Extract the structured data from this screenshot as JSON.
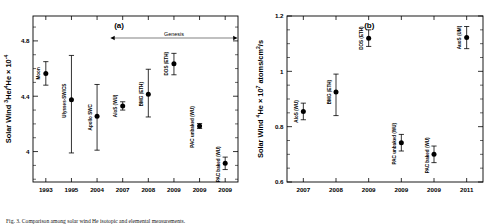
{
  "figure": {
    "caption": "Fig. 3. Comparison among solar wind He isotopic and elemental measurements."
  },
  "chart_data": [
    {
      "type": "scatter",
      "panel_label": "(a)",
      "title": "",
      "xlabel": "",
      "ylabel": "Solar Wind 3He/4He × 10-4",
      "ylabel_parts": {
        "prefix": "Solar Wind ",
        "sup1": "3",
        "mid1": "He/",
        "sup2": "4",
        "mid2": "He × 10",
        "sup3": "-4"
      },
      "ylim": [
        3.78,
        4.98
      ],
      "yticks": [
        4,
        4.4,
        4.8
      ],
      "yticklabels": [
        "4",
        "4.4",
        "4.8"
      ],
      "xticklabels": [
        "1993",
        "1995",
        "2004",
        "2007",
        "2008",
        "2009",
        "2009",
        "2009"
      ],
      "grid": false,
      "annotation": {
        "text": "Genesis",
        "x_start_index": 3,
        "x_end_index": 7
      },
      "points": [
        {
          "label": "Moon",
          "x_index": 0,
          "y": 4.565,
          "err_low": 0.085,
          "err_high": 0.085
        },
        {
          "label": "Ulysses-SWICS",
          "x_index": 1,
          "y": 4.375,
          "err_low": 0.385,
          "err_high": 0.32
        },
        {
          "label": "Apollo SWC",
          "x_index": 2,
          "y": 4.255,
          "err_low": 0.245,
          "err_high": 0.23
        },
        {
          "label": "AloS (WU)",
          "x_index": 3,
          "y": 4.33,
          "err_low": 0.03,
          "err_high": 0.03
        },
        {
          "label": "BMG (ETH)",
          "x_index": 4,
          "y": 4.415,
          "err_low": 0.165,
          "err_high": 0.18
        },
        {
          "label": "DOS (ETH)",
          "x_index": 5,
          "y": 4.635,
          "err_low": 0.08,
          "err_high": 0.075
        },
        {
          "label": "PAC unbaked (WU)",
          "x_index": 6,
          "y": 4.185,
          "err_low": 0.018,
          "err_high": 0.018
        },
        {
          "label": "PAC baked (WU)",
          "x_index": 7,
          "y": 3.915,
          "err_low": 0.045,
          "err_high": 0.045
        }
      ]
    },
    {
      "type": "scatter",
      "panel_label": "(b)",
      "title": "",
      "xlabel": "",
      "ylabel": "Solar Wind 4He × 107 atoms/cm2/s",
      "ylabel_parts": {
        "prefix": "Solar Wind ",
        "sup1": "4",
        "mid1": "He × 10",
        "sup2": "7",
        "mid2": " atoms/cm",
        "sup3": "2",
        "suffix": "/s"
      },
      "ylim": [
        0.6,
        1.2
      ],
      "yticks": [
        0.6,
        0.8,
        1,
        1.2
      ],
      "yticklabels": [
        "0.6",
        "0.8",
        "1",
        "1.2"
      ],
      "xticklabels": [
        "2007",
        "2008",
        "2009",
        "2009",
        "2009",
        "2011"
      ],
      "grid": false,
      "points": [
        {
          "label": "AloS (WU)",
          "x_index": 0,
          "y": 0.855,
          "err_low": 0.03,
          "err_high": 0.03
        },
        {
          "label": "BMG (ETH)",
          "x_index": 1,
          "y": 0.925,
          "err_low": 0.085,
          "err_high": 0.065
        },
        {
          "label": "DOS (ETH)",
          "x_index": 2,
          "y": 1.12,
          "err_low": 0.03,
          "err_high": 0.03
        },
        {
          "label": "PAC unbaked (WU)",
          "x_index": 3,
          "y": 0.742,
          "err_low": 0.03,
          "err_high": 0.03
        },
        {
          "label": "PAC baked (WU)",
          "x_index": 4,
          "y": 0.7,
          "err_low": 0.03,
          "err_high": 0.03
        },
        {
          "label": "AuoS (UM)",
          "x_index": 5,
          "y": 1.122,
          "err_low": 0.04,
          "err_high": 0.04
        }
      ]
    }
  ]
}
